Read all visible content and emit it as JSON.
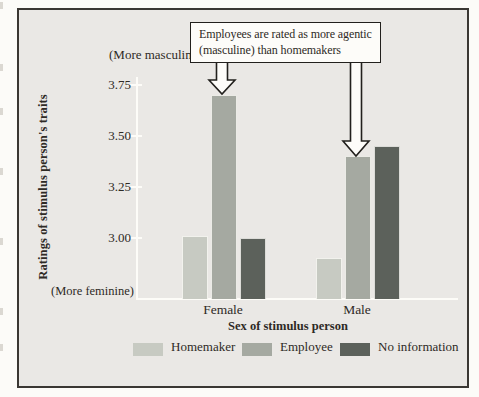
{
  "figure": {
    "callout_line1": "Employees are rated as more agentic",
    "callout_line2": "(masculine) than homemakers"
  },
  "chart_data": {
    "type": "bar",
    "title": "",
    "categories": [
      "Female",
      "Male"
    ],
    "series": [
      {
        "name": "Homemaker",
        "values": [
          3.01,
          2.9
        ],
        "color": "#c7cac2"
      },
      {
        "name": "Employee",
        "values": [
          3.7,
          3.4
        ],
        "color": "#a5a9a1"
      },
      {
        "name": "No information",
        "values": [
          3.0,
          3.45
        ],
        "color": "#5c615b"
      }
    ],
    "xlabel": "Sex of stimulus person",
    "ylabel": "Ratings of stimulus person's traits",
    "yticks": [
      3.75,
      3.5,
      3.25,
      3.0
    ],
    "ylim": [
      2.7,
      3.85
    ],
    "grid": false,
    "legend_position": "bottom",
    "y_annotations": {
      "top": "(More masculine)",
      "bottom": "(More feminine)"
    },
    "annotation": "Employees are rated as more agentic (masculine) than homemakers"
  },
  "colors": {
    "figure_background": "#eae8e5",
    "page_background": "#fcfbf8",
    "axis_line": "#fdfcf8",
    "border": "#3a3733",
    "text": "#2e2a25",
    "bar_homemaker": "#c7cac2",
    "bar_employee": "#a5a9a1",
    "bar_no_information": "#5c615b",
    "callout_background": "#fdfcf9"
  }
}
